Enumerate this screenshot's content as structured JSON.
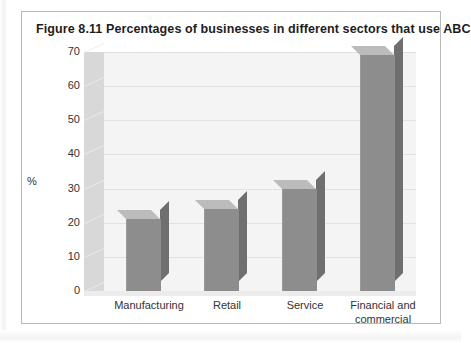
{
  "figure": {
    "caption_number": "Figure 8.11",
    "caption_text": "Percentages of businesses in different sectors that use ABC",
    "full_title": "Figure 8.11  Percentages of businesses in different sectors that use ABC"
  },
  "colors": {
    "bar_front": "#8d8d8d",
    "bar_side": "#6f6f6f",
    "bar_top": "#bcbcbc",
    "plot_background": "#f4f4f4",
    "wall": "#d8d8d8",
    "gridline": "#e1e1e1",
    "frame_border": "#b9b9b9",
    "text": "#333333"
  },
  "chart_data": {
    "type": "bar",
    "title": "Figure 8.11  Percentages of businesses in different sectors that use ABC",
    "xlabel": "",
    "ylabel": "%",
    "categories": [
      "Manufacturing",
      "Retail",
      "Service",
      "Financial and commercial"
    ],
    "category_lines": [
      [
        "Manufacturing"
      ],
      [
        "Retail"
      ],
      [
        "Service"
      ],
      [
        "Financial and",
        "commercial"
      ]
    ],
    "values": [
      21,
      24,
      30,
      69
    ],
    "ylim": [
      0,
      70
    ],
    "yticks": [
      0,
      10,
      20,
      30,
      40,
      50,
      60,
      70
    ],
    "ytick_labels": [
      "0",
      "10",
      "20",
      "30",
      "40",
      "50",
      "60",
      "70"
    ],
    "grid": true,
    "legend": false,
    "style": "3d-column"
  }
}
